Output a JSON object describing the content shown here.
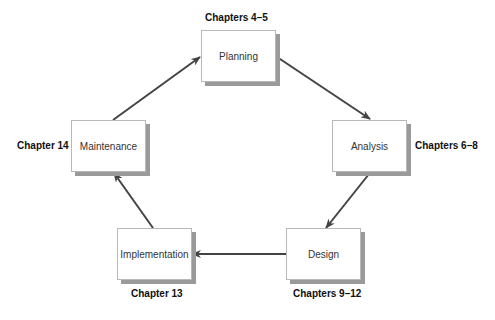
{
  "diagram": {
    "type": "cycle",
    "stages": [
      {
        "id": "planning",
        "name": "Planning",
        "chapters": "Chapters 4–5"
      },
      {
        "id": "analysis",
        "name": "Analysis",
        "chapters": "Chapters 6–8"
      },
      {
        "id": "design",
        "name": "Design",
        "chapters": "Chapters 9–12"
      },
      {
        "id": "implementation",
        "name": "Implementation",
        "chapters": "Chapter 13"
      },
      {
        "id": "maintenance",
        "name": "Maintenance",
        "chapters": "Chapter 14"
      }
    ],
    "edges": [
      {
        "from": "planning",
        "to": "analysis"
      },
      {
        "from": "analysis",
        "to": "design"
      },
      {
        "from": "design",
        "to": "implementation"
      },
      {
        "from": "implementation",
        "to": "maintenance"
      },
      {
        "from": "maintenance",
        "to": "planning"
      }
    ],
    "colors": {
      "arrow": "#444444",
      "shadow": "#9a9a9a",
      "border": "#b8b8b8"
    }
  }
}
